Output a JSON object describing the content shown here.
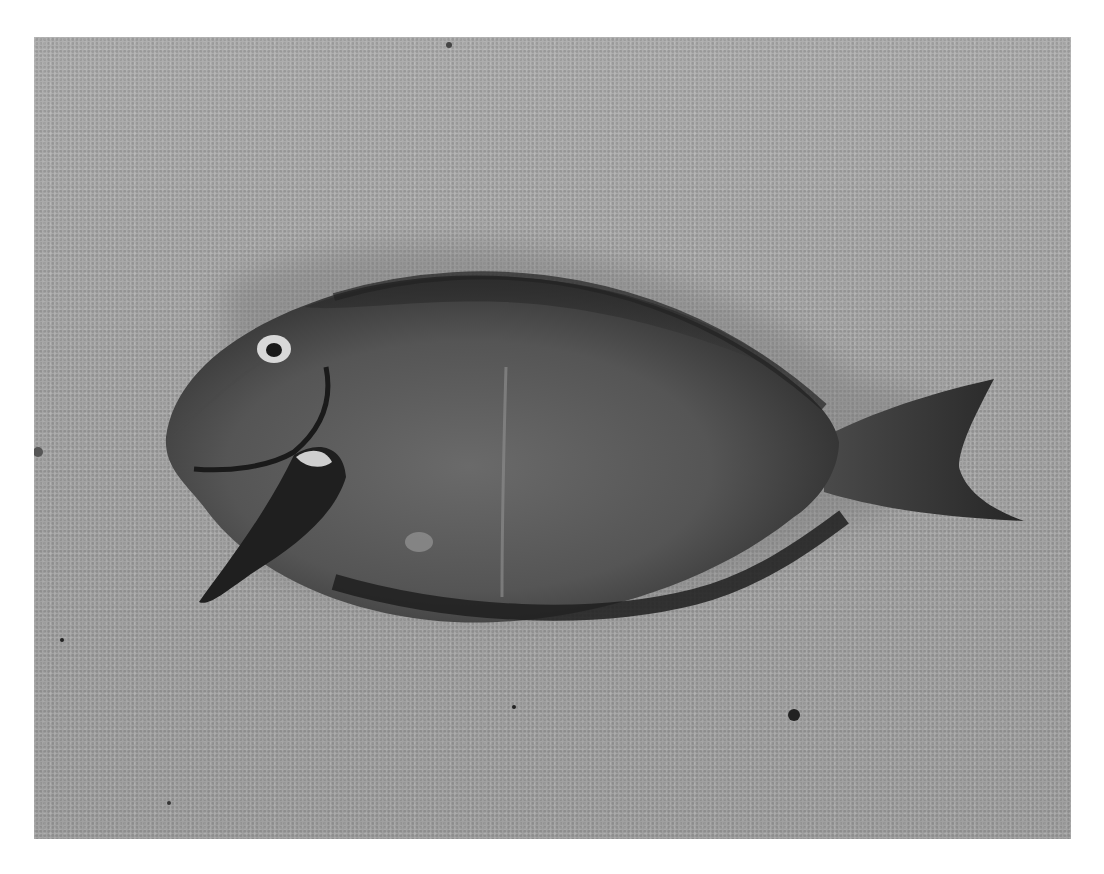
{
  "image": {
    "subject": "fish lying on sand",
    "style": "grayscale photograph",
    "colors": {
      "sand": "#a9a9a9",
      "fish_body": "#5e5e5e",
      "fish_dark": "#2c2c2c",
      "fin_dark": "#1e1e1e",
      "background": "#ffffff"
    }
  },
  "caption": {
    "text": ""
  }
}
